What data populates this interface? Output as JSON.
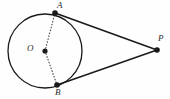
{
  "figure": {
    "kind": "geometry-diagram",
    "background_color": "#fefefe",
    "stroke_color": "#1a1a1a",
    "dotted_stroke_color": "#3a3a3a",
    "label_color": "#2b2b2b",
    "canvas": {
      "width": 170,
      "height": 99
    },
    "circle": {
      "name": "main-circle",
      "center_x": 45,
      "center_y": 51,
      "radius": 37,
      "stroke_width": 1.3
    },
    "points": [
      {
        "id": "O",
        "label": "O",
        "x": 45,
        "y": 51,
        "dot_radius": 2.6,
        "label_x": 27,
        "label_y": 44
      },
      {
        "id": "A",
        "label": "A",
        "x": 55,
        "y": 13,
        "dot_radius": 2.8,
        "label_x": 57,
        "label_y": 1
      },
      {
        "id": "B",
        "label": "B",
        "x": 57,
        "y": 85,
        "dot_radius": 2.8,
        "label_x": 55,
        "label_y": 88
      },
      {
        "id": "P",
        "label": "P",
        "x": 157,
        "y": 50,
        "dot_radius": 2.8,
        "label_x": 158,
        "label_y": 34
      }
    ],
    "segments": [
      {
        "id": "OA",
        "from": "O",
        "to": "A",
        "style": "dotted",
        "x1": 45,
        "y1": 51,
        "x2": 55,
        "y2": 13,
        "stroke_width": 1.1
      },
      {
        "id": "OB",
        "from": "O",
        "to": "B",
        "style": "dotted",
        "x1": 45,
        "y1": 51,
        "x2": 57,
        "y2": 85,
        "stroke_width": 1.1
      },
      {
        "id": "AP",
        "from": "A",
        "to": "P",
        "style": "solid",
        "x1": 55,
        "y1": 13,
        "x2": 157,
        "y2": 50,
        "stroke_width": 1.5
      },
      {
        "id": "BP",
        "from": "B",
        "to": "P",
        "style": "solid",
        "x1": 57,
        "y1": 85,
        "x2": 157,
        "y2": 50,
        "stroke_width": 1.5
      }
    ]
  }
}
